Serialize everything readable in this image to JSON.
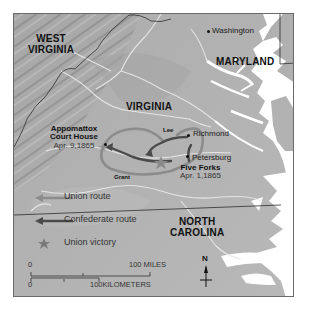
{
  "map": {
    "title": "",
    "states": {
      "west_virginia": [
        "WEST",
        "VIRGINIA"
      ],
      "maryland": "MARYLAND",
      "virginia": "VIRGINIA",
      "north_carolina": [
        "NORTH",
        "CAROLINA"
      ]
    },
    "cities": {
      "washington": "Washington",
      "richmond": "Richmond",
      "petersburg": "Petersburg"
    },
    "battles": [
      {
        "name_lines": [
          "Appomattox",
          "Court House"
        ],
        "date": "Apr. 9,1865"
      },
      {
        "name_lines": [
          "Five Forks"
        ],
        "date": "Apr. 1,1865"
      }
    ],
    "generals": {
      "union": "Grant",
      "confederate": "Lee"
    },
    "legend": {
      "items": [
        {
          "label": "Union route",
          "icon": "union-route-arrow-icon",
          "color": "#8c8c8c"
        },
        {
          "label": "Confederate route",
          "icon": "confederate-route-arrow-icon",
          "color": "#4a4a4a"
        },
        {
          "label": "Union victory",
          "icon": "union-victory-star-icon",
          "color": "#7a7a7a"
        }
      ]
    },
    "scale": {
      "miles_start": "0",
      "miles_end": "100 MILES",
      "km_start": "0",
      "km_end": "100KILOMETERS"
    },
    "north_arrow": "N",
    "colors": {
      "land": "#a9a9a9",
      "water": "#ffffff",
      "border": "#3a3a3a",
      "union_route": "#8c8c8c",
      "confederate_route": "#4a4a4a"
    }
  }
}
